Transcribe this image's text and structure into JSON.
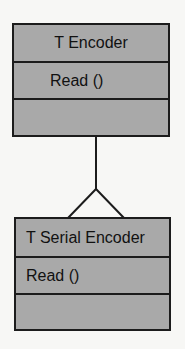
{
  "diagram": {
    "type": "UML class diagram (inheritance)",
    "colors": {
      "background": "#f7f7f5",
      "box_fill": "#a9a9a9",
      "stroke": "#1c1c1c"
    },
    "classes": [
      {
        "name": "T Encoder",
        "operations": [
          "Read ()"
        ],
        "attributes": []
      },
      {
        "name": "T Serial Encoder",
        "operations": [
          "Read ()"
        ],
        "attributes": []
      }
    ],
    "relationships": [
      {
        "type": "inheritance",
        "from": "T Serial Encoder",
        "to": "T Encoder",
        "arrow": "open-triangle"
      }
    ]
  }
}
